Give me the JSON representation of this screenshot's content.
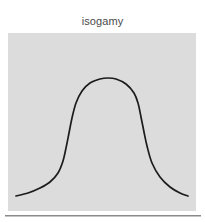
{
  "figure": {
    "title": "isogamy",
    "panel_background_color": "#dcdcdc",
    "page_background_color": "#ffffff",
    "curve_color": "#1c1c1c",
    "divider_color": "#8a8a8a"
  },
  "chart_data": {
    "type": "line",
    "title": "isogamy",
    "subtitle": "",
    "xlabel": "",
    "ylabel": "",
    "grid": false,
    "legend": null,
    "axis_ticks": {
      "x": [],
      "y": []
    },
    "xlim": [
      0,
      188
    ],
    "ylim": [
      0,
      178
    ],
    "series": [
      {
        "name": "isogamy distribution",
        "comment": "flat-topped (platykurtic / mesa-shaped) unimodal curve, symmetric about center",
        "x": [
          8,
          20,
          32,
          42,
          50,
          55,
          58,
          61,
          64,
          68,
          74,
          82,
          92,
          100,
          108,
          118,
          126,
          130,
          133,
          136,
          139,
          144,
          152,
          162,
          172,
          180
        ],
        "y": [
          163,
          160,
          155,
          149,
          140,
          128,
          115,
          100,
          85,
          70,
          58,
          50,
          46,
          45,
          46,
          51,
          60,
          70,
          84,
          99,
          113,
          130,
          144,
          154,
          160,
          163
        ]
      }
    ],
    "annotations": []
  }
}
